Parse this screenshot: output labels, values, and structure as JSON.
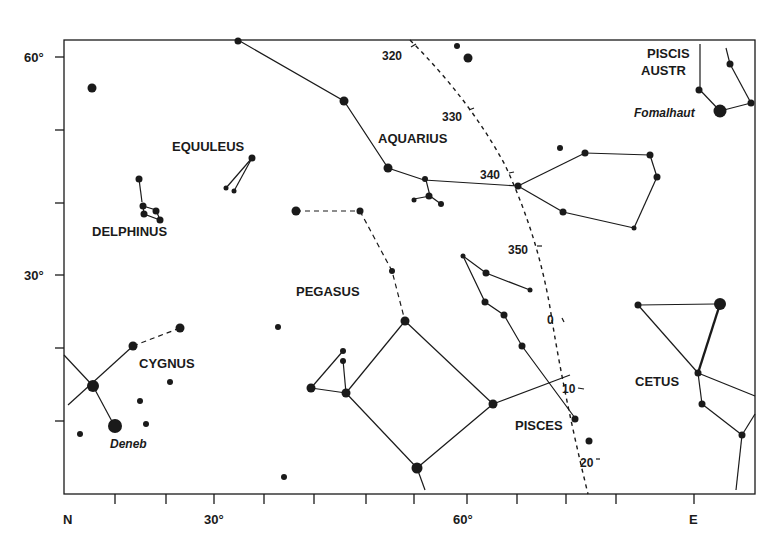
{
  "colors": {
    "ink": "#1a1a1a",
    "background": "#ffffff"
  },
  "axes": {
    "x_labels": [
      {
        "text": "N",
        "x": 69
      },
      {
        "text": "30°",
        "x": 273
      },
      {
        "text": "60°",
        "x": 485
      },
      {
        "text": "E",
        "x": 695
      }
    ],
    "y_labels": [
      {
        "text": "60°",
        "y": 60
      },
      {
        "text": "30°",
        "y": 278
      }
    ]
  },
  "constellations": [
    {
      "name": "EQUULEUS",
      "x": 172,
      "y": 151
    },
    {
      "name": "DELPHINUS",
      "x": 92,
      "y": 236
    },
    {
      "name": "AQUARIUS",
      "x": 378,
      "y": 143
    },
    {
      "name": "PEGASUS",
      "x": 296,
      "y": 296
    },
    {
      "name": "CYGNUS",
      "x": 139,
      "y": 368
    },
    {
      "name": "PISCES",
      "x": 515,
      "y": 430
    },
    {
      "name": "CETUS",
      "x": 635,
      "y": 386
    },
    {
      "name": "PISCIS",
      "x": 647,
      "y": 58
    },
    {
      "name": "AUSTR",
      "x": 641,
      "y": 75
    }
  ],
  "named_stars": [
    {
      "name": "Deneb",
      "x": 110,
      "y": 448
    },
    {
      "name": "Fomalhaut",
      "x": 634,
      "y": 117
    }
  ],
  "ecliptic_ticks": [
    {
      "label": "320",
      "x": 405,
      "y": 60
    },
    {
      "label": "330",
      "x": 441,
      "y": 120
    },
    {
      "label": "340",
      "x": 480,
      "y": 178
    },
    {
      "label": "350",
      "x": 508,
      "y": 254
    },
    {
      "label": "0",
      "x": 546,
      "y": 323
    },
    {
      "label": "10",
      "x": 562,
      "y": 393
    },
    {
      "label": "20",
      "x": 581,
      "y": 466
    }
  ]
}
